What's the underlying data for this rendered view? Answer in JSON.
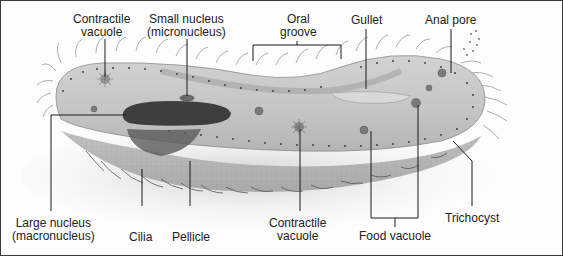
{
  "diagram": {
    "labels": {
      "contractile_vacuole_top": "Contractile\nvacuole",
      "small_nucleus": "Small nucleus\n(micronucleus)",
      "oral_groove": "Oral\ngroove",
      "gullet": "Gullet",
      "anal_pore": "Anal pore",
      "large_nucleus": "Large nucleus\n(macronucleus)",
      "cilia": "Cilia",
      "pellicle": "Pellicle",
      "contractile_vacuole_bottom": "Contractile\nvacuole",
      "food_vacuole": "Food vacuole",
      "trichocyst": "Trichocyst"
    },
    "colors": {
      "body": "#c9c9c9",
      "body_dark": "#9a9a9a",
      "nucleus": "#3e3e3e",
      "leader_line": "#1a1a1a",
      "border": "#3a3a3a",
      "shadow": "#d8d8d8"
    }
  }
}
